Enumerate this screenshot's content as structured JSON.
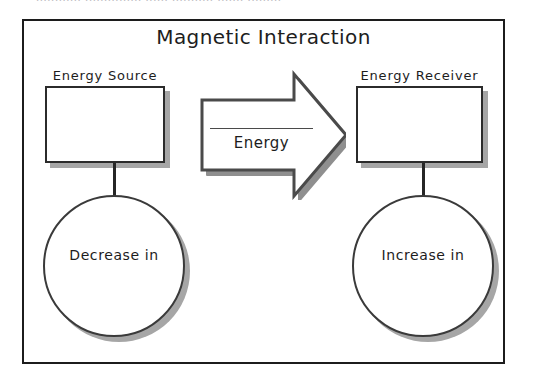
{
  "page": {
    "clipped_top_text": "............ ............... ...... ........... ....... ........."
  },
  "diagram": {
    "title": "Magnetic Interaction",
    "source": {
      "label": "Energy Source",
      "box_content": "",
      "effect": "Decrease in"
    },
    "receiver": {
      "label": "Energy Receiver",
      "box_content": "",
      "effect": "Increase in"
    },
    "flow": {
      "label": "Energy",
      "direction": "right"
    },
    "colors": {
      "frame": "#1c1c1c",
      "shape_outline": "#2b2b2b",
      "shadow": "#a6a6a6",
      "arrow_outline": "#4a4a4a",
      "arrow_fill": "#ffffff",
      "text": "#1d1d1d"
    }
  }
}
